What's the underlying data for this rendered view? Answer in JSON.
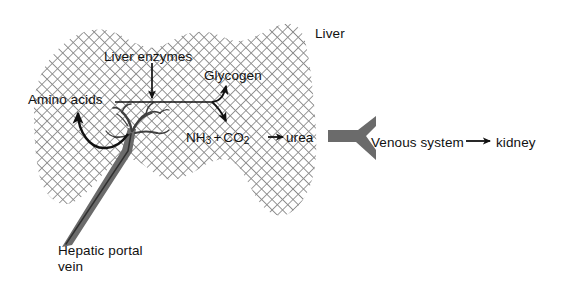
{
  "diagram": {
    "organ_label": "Liver",
    "labels": {
      "liver": "Liver",
      "liver_enzymes": "Liver enzymes",
      "glycogen": "Glycogen",
      "amino_acids": "Amino acids",
      "ammonia": "NH",
      "ammonia_sub": "3",
      "plus": "+",
      "carbon_dioxide": "CO",
      "carbon_dioxide_sub": "2",
      "urea": "urea",
      "venous_system": "Venous system",
      "kidney": "kidney",
      "hepatic_portal_vein_line1": "Hepatic portal",
      "hepatic_portal_vein_line2": "vein"
    },
    "arrows": [
      {
        "name": "enzymes-to-reaction",
        "from": "Liver enzymes",
        "to": "reaction line",
        "direction": "down"
      },
      {
        "name": "reaction-to-glycogen",
        "from": "Amino acids",
        "to": "Glycogen",
        "direction": "up-right"
      },
      {
        "name": "reaction-to-ammonia",
        "from": "Amino acids",
        "to": "NH3 + CO2",
        "direction": "down-right"
      },
      {
        "name": "ammonia-to-urea",
        "from": "NH3 + CO2",
        "to": "urea",
        "direction": "right"
      },
      {
        "name": "portal-vein-to-amino-acids",
        "from": "Hepatic portal vein",
        "to": "Amino acids",
        "direction": "curve-left-up"
      },
      {
        "name": "venous-to-kidney",
        "from": "Venous system",
        "to": "kidney",
        "direction": "right"
      }
    ],
    "vessels": [
      {
        "name": "hepatic-portal-vein",
        "color": "#6b6b6b"
      },
      {
        "name": "venous-system-vessel",
        "color": "#6b6b6b"
      }
    ],
    "colors": {
      "ink": "#111111",
      "vessel": "#6b6b6b",
      "vessel_dark": "#3f3f3f",
      "hatch": "#8a8a8a",
      "background": "#ffffff"
    }
  }
}
